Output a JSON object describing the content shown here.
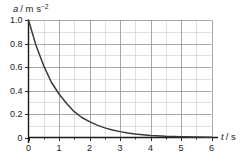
{
  "chart_data": {
    "type": "line",
    "title": "",
    "subtitle": "",
    "xlabel": "t / s",
    "xlabel_symbol": "t",
    "xlabel_unit": "/ s",
    "ylabel": "a / m s⁻²",
    "ylabel_symbol": "a",
    "ylabel_unit": "/ m s",
    "ylabel_exponent": "−2",
    "xlim": [
      0,
      6
    ],
    "ylim": [
      0,
      1.0
    ],
    "xticks": [
      0,
      1,
      2,
      3,
      4,
      5,
      6
    ],
    "xtick_labels": [
      "0",
      "1",
      "2",
      "3",
      "4",
      "5",
      "6"
    ],
    "yticks": [
      0,
      0.2,
      0.4,
      0.6,
      0.8,
      1.0
    ],
    "ytick_labels": [
      "0",
      "0.2",
      "0.4",
      "0.6",
      "0.8",
      "1.0"
    ],
    "x_minor_step": 0.5,
    "y_minor_step": 0.1,
    "grid": true,
    "grid_major_color": "#9e9e9e",
    "grid_minor_color": "#d8d8d8",
    "legend": "none",
    "curve_color": "#3a3a3a",
    "series": [
      {
        "name": "a(t)",
        "x": [
          0,
          0.25,
          0.5,
          0.75,
          1.0,
          1.25,
          1.5,
          1.75,
          2.0,
          2.25,
          2.5,
          2.75,
          3.0,
          3.25,
          3.5,
          3.75,
          4.0,
          4.5,
          5.0,
          5.5,
          6.0
        ],
        "values": [
          1.0,
          0.78,
          0.61,
          0.47,
          0.37,
          0.29,
          0.22,
          0.17,
          0.135,
          0.105,
          0.082,
          0.064,
          0.05,
          0.039,
          0.03,
          0.024,
          0.018,
          0.011,
          0.007,
          0.004,
          0.0025
        ]
      }
    ]
  }
}
